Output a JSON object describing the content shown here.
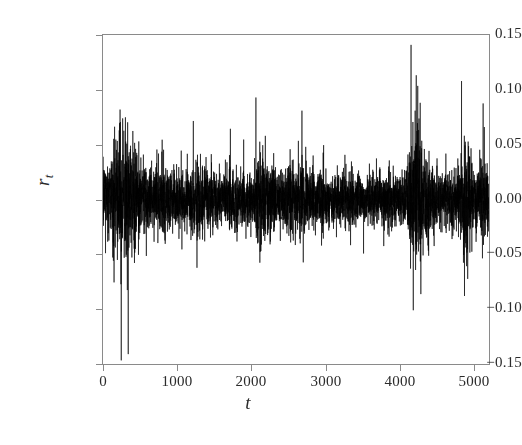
{
  "chart_data": {
    "type": "line",
    "title": "",
    "subtitle": "",
    "xlabel": "t",
    "ylabel": "r_t",
    "xlabel_display": "t",
    "ylabel_base": "r",
    "ylabel_sub": "t",
    "xlim": [
      0,
      5200
    ],
    "ylim": [
      -0.15,
      0.15
    ],
    "xticks": [
      0,
      1000,
      2000,
      3000,
      4000,
      5000
    ],
    "xtick_labels": [
      "0",
      "1000",
      "2000",
      "3000",
      "4000",
      "5000"
    ],
    "yticks": [
      0.15,
      0.1,
      0.05,
      0.0,
      -0.05,
      -0.1,
      -0.15
    ],
    "ytick_labels": [
      "0.15",
      "0.10",
      "0.05",
      "0.00",
      "−0.05",
      "−0.10",
      "−0.15"
    ],
    "grid": false,
    "legend": null,
    "line_color": "#000000",
    "line_width": 0.6,
    "frame_color": "#8a8a8a",
    "background": "#ffffff",
    "n_points": 5200,
    "series_name": "r_t",
    "mean": 0.0,
    "observed_min": -0.141,
    "observed_max": 0.141,
    "volatility_profile": {
      "baseline_sigma": 0.0092,
      "comment": "Local standard deviation of returns as a function of t, read from the visual envelope of the series.",
      "t_knots": [
        0,
        120,
        200,
        280,
        340,
        420,
        520,
        650,
        780,
        900,
        1020,
        1150,
        1300,
        1450,
        1600,
        1750,
        1900,
        2020,
        2120,
        2260,
        2400,
        2550,
        2700,
        2800,
        2950,
        3100,
        3250,
        3400,
        3550,
        3700,
        3850,
        3980,
        4080,
        4150,
        4230,
        4330,
        4450,
        4600,
        4720,
        4820,
        4920,
        5050,
        5200
      ],
      "sigma_knots": [
        0.016,
        0.02,
        0.026,
        0.03,
        0.028,
        0.022,
        0.015,
        0.013,
        0.019,
        0.016,
        0.012,
        0.014,
        0.018,
        0.013,
        0.012,
        0.014,
        0.012,
        0.013,
        0.021,
        0.016,
        0.013,
        0.015,
        0.019,
        0.014,
        0.013,
        0.011,
        0.012,
        0.013,
        0.011,
        0.012,
        0.013,
        0.011,
        0.013,
        0.03,
        0.034,
        0.02,
        0.013,
        0.012,
        0.013,
        0.02,
        0.024,
        0.018,
        0.015
      ]
    },
    "notable_features": [
      {
        "t": 340,
        "value": -0.141,
        "label": "largest negative spike"
      },
      {
        "t": 4150,
        "value": 0.141,
        "label": "largest positive spike"
      },
      {
        "t": 4180,
        "value": -0.101,
        "label": "deep drop following positive spike"
      },
      {
        "t": 230,
        "value": 0.082,
        "label": "early volatility cluster peak"
      },
      {
        "t": 4830,
        "value": 0.108,
        "label": "late positive spike"
      },
      {
        "t": 4870,
        "value": -0.088,
        "label": "late negative spike"
      },
      {
        "t": 2060,
        "value": 0.093,
        "label": "mid-sample cluster peak"
      },
      {
        "t": 2680,
        "value": 0.081,
        "label": "secondary mid-sample peak"
      }
    ]
  }
}
